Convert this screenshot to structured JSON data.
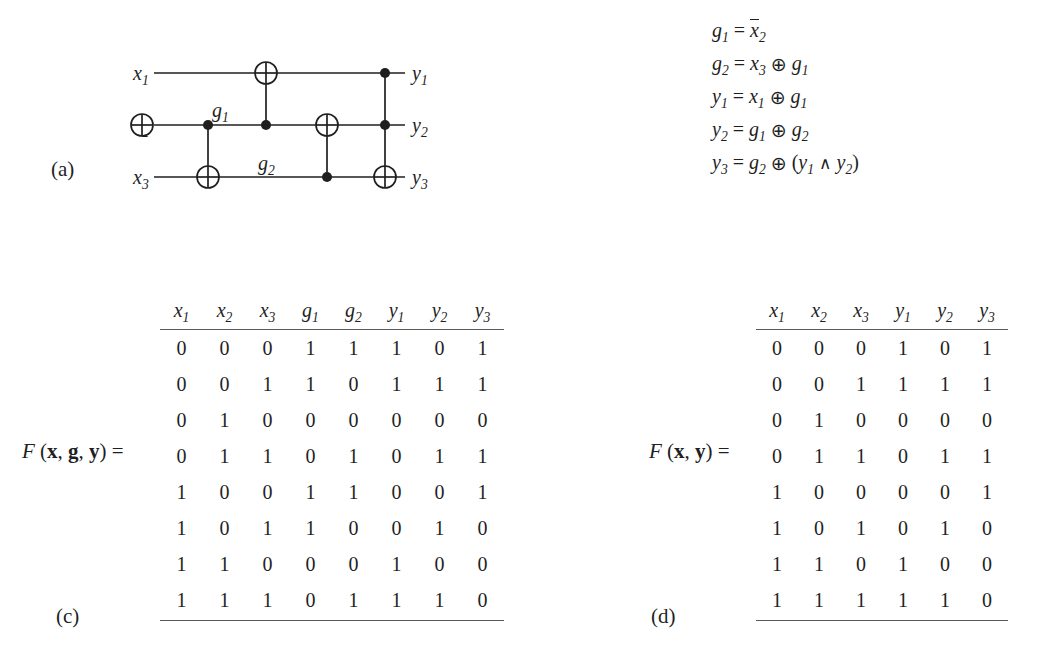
{
  "figure": {
    "panels": {
      "a": "(a)",
      "b": "(b)",
      "c": "(c)",
      "d": "(d)"
    }
  },
  "circuit": {
    "inputs": [
      "x₁",
      "x₂",
      "x₃"
    ],
    "outputs": [
      "y₁",
      "y₂",
      "y₃"
    ],
    "intermediate_labels": [
      "g₁",
      "g₂"
    ],
    "input_labels": [
      {
        "base": "x",
        "sub": "1"
      },
      {
        "base": "x",
        "sub": "2"
      },
      {
        "base": "x",
        "sub": "3"
      }
    ],
    "output_labels": [
      {
        "base": "y",
        "sub": "1"
      },
      {
        "base": "y",
        "sub": "2"
      },
      {
        "base": "y",
        "sub": "3"
      }
    ],
    "gate_labels": [
      {
        "base": "g",
        "sub": "1"
      },
      {
        "base": "g",
        "sub": "2"
      }
    ]
  },
  "equations": {
    "rows": [
      {
        "lhs_base": "g",
        "lhs_sub": "1",
        "rhs": "x̅₂"
      },
      {
        "lhs_base": "g",
        "lhs_sub": "2",
        "rhs": "x₃ ⊕ g₁"
      },
      {
        "lhs_base": "y",
        "lhs_sub": "1",
        "rhs": "x₁ ⊕ g₁"
      },
      {
        "lhs_base": "y",
        "lhs_sub": "2",
        "rhs": "g₁ ⊕ g₂"
      },
      {
        "lhs_base": "y",
        "lhs_sub": "3",
        "rhs": "g₂ ⊕ (y₁ ∧ y₂)"
      }
    ],
    "xor_symbol": "⊕",
    "and_symbol": "∧"
  },
  "table_c": {
    "f_label": "F (x, g, y) =",
    "columns": [
      {
        "base": "x",
        "sub": "1"
      },
      {
        "base": "x",
        "sub": "2"
      },
      {
        "base": "x",
        "sub": "3"
      },
      {
        "base": "g",
        "sub": "1"
      },
      {
        "base": "g",
        "sub": "2"
      },
      {
        "base": "y",
        "sub": "1"
      },
      {
        "base": "y",
        "sub": "2"
      },
      {
        "base": "y",
        "sub": "3"
      }
    ],
    "rows": [
      [
        0,
        0,
        0,
        1,
        1,
        1,
        0,
        1
      ],
      [
        0,
        0,
        1,
        1,
        0,
        1,
        1,
        1
      ],
      [
        0,
        1,
        0,
        0,
        0,
        0,
        0,
        0
      ],
      [
        0,
        1,
        1,
        0,
        1,
        0,
        1,
        1
      ],
      [
        1,
        0,
        0,
        1,
        1,
        0,
        0,
        1
      ],
      [
        1,
        0,
        1,
        1,
        0,
        0,
        1,
        0
      ],
      [
        1,
        1,
        0,
        0,
        0,
        1,
        0,
        0
      ],
      [
        1,
        1,
        1,
        0,
        1,
        1,
        1,
        0
      ]
    ]
  },
  "table_d": {
    "f_label": "F (x, y) =",
    "columns": [
      {
        "base": "x",
        "sub": "1"
      },
      {
        "base": "x",
        "sub": "2"
      },
      {
        "base": "x",
        "sub": "3"
      },
      {
        "base": "y",
        "sub": "1"
      },
      {
        "base": "y",
        "sub": "2"
      },
      {
        "base": "y",
        "sub": "3"
      }
    ],
    "rows": [
      [
        0,
        0,
        0,
        1,
        0,
        1
      ],
      [
        0,
        0,
        1,
        1,
        1,
        1
      ],
      [
        0,
        1,
        0,
        0,
        0,
        0
      ],
      [
        0,
        1,
        1,
        0,
        1,
        1
      ],
      [
        1,
        0,
        0,
        0,
        0,
        1
      ],
      [
        1,
        0,
        1,
        0,
        1,
        0
      ],
      [
        1,
        1,
        0,
        1,
        0,
        0
      ],
      [
        1,
        1,
        1,
        1,
        1,
        0
      ]
    ]
  },
  "colors": {
    "ink": "#1f1f1f",
    "rule": "#5a5a5a",
    "background": "#ffffff"
  }
}
